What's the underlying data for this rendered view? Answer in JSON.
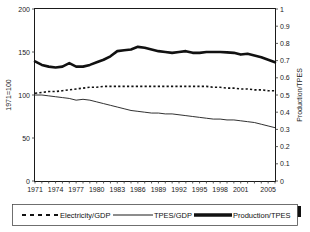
{
  "chart_data": {
    "type": "line",
    "title": "",
    "xlabel": "",
    "ylabel": "1971=100",
    "y2label": "Production/TPES",
    "grid": false,
    "legend_position": "bottom",
    "x": [
      1971,
      1972,
      1973,
      1974,
      1975,
      1976,
      1977,
      1978,
      1979,
      1980,
      1981,
      1982,
      1983,
      1984,
      1985,
      1986,
      1987,
      1988,
      1989,
      1990,
      1991,
      1992,
      1993,
      1994,
      1995,
      1996,
      1997,
      1998,
      1999,
      2000,
      2001,
      2002,
      2003,
      2004,
      2005,
      2006
    ],
    "xtick_labels": [
      "1971",
      "1974",
      "1977",
      "1980",
      "1983",
      "1986",
      "1989",
      "1992",
      "1995",
      "1998",
      "2001",
      "2005"
    ],
    "xtick_values": [
      1971,
      1974,
      1977,
      1980,
      1983,
      1986,
      1989,
      1992,
      1995,
      1998,
      2001,
      2005
    ],
    "ylim": [
      0,
      200
    ],
    "ytick_labels": [
      "0",
      "50",
      "100",
      "150",
      "200"
    ],
    "ytick_values": [
      0,
      50,
      100,
      150,
      200
    ],
    "y2lim": [
      0,
      1
    ],
    "y2tick_labels": [
      "0",
      "0.1",
      "0.2",
      "0.3",
      "0.4",
      "0.5",
      "0.6",
      "0.7",
      "0.8",
      "0.9",
      "1"
    ],
    "y2tick_values": [
      0,
      0.1,
      0.2,
      0.3,
      0.4,
      0.5,
      0.6,
      0.7,
      0.8,
      0.9,
      1
    ],
    "series": [
      {
        "name": "Electricity/GDP",
        "axis": "left",
        "style": "dotted",
        "color": "#111111",
        "values": [
          102,
          103,
          104,
          104,
          105,
          106,
          107,
          108,
          109,
          109,
          110,
          110,
          110,
          110,
          110,
          110,
          110,
          110,
          110,
          110,
          110,
          110,
          110,
          110,
          110,
          110,
          109,
          109,
          108,
          108,
          107,
          107,
          106,
          106,
          105,
          105
        ]
      },
      {
        "name": "TPES/GDP",
        "axis": "left",
        "style": "thin-solid",
        "color": "#1a1a1a",
        "values": [
          100,
          100,
          99,
          98,
          97,
          96,
          94,
          95,
          94,
          92,
          90,
          88,
          86,
          84,
          82,
          81,
          80,
          79,
          79,
          78,
          78,
          77,
          76,
          75,
          74,
          73,
          72,
          72,
          71,
          71,
          70,
          69,
          68,
          66,
          64,
          62
        ]
      },
      {
        "name": "Production/TPES",
        "axis": "right",
        "style": "thick-solid",
        "color": "#111111",
        "values": [
          0.695,
          0.675,
          0.665,
          0.66,
          0.665,
          0.685,
          0.665,
          0.665,
          0.675,
          0.69,
          0.705,
          0.725,
          0.755,
          0.76,
          0.765,
          0.78,
          0.775,
          0.765,
          0.755,
          0.75,
          0.745,
          0.75,
          0.755,
          0.745,
          0.745,
          0.75,
          0.75,
          0.75,
          0.748,
          0.745,
          0.735,
          0.74,
          0.73,
          0.72,
          0.705,
          0.69
        ]
      }
    ]
  },
  "legend": {
    "items": [
      {
        "label": "Electricity/GDP",
        "marker": "dotted-line"
      },
      {
        "label": "TPES/GDP",
        "marker": "thin-line"
      },
      {
        "label": "Production/TPES",
        "marker": "thick-line"
      }
    ]
  }
}
